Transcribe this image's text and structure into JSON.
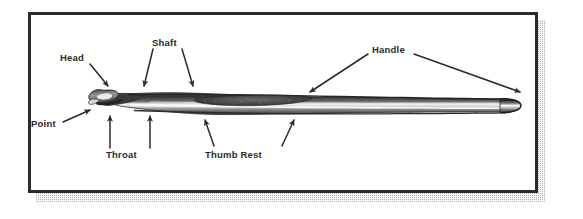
{
  "figure": {
    "frame": {
      "border_color": "#2b2b2b",
      "background_color": "#ffffff",
      "shadow_color": "#9a9a9a"
    },
    "palette": {
      "ink": "#2a2a2a",
      "metal_dark": "#3a3a3a",
      "metal_mid": "#6f6f6f",
      "metal_light": "#d8d8d8",
      "metal_highlight": "#f2f2f2",
      "paper": "#ffffff"
    }
  },
  "labels": [
    {
      "id": "head",
      "text": "Head",
      "arrows": 1
    },
    {
      "id": "point",
      "text": "Point",
      "arrows": 1
    },
    {
      "id": "shaft",
      "text": "Shaft",
      "arrows": 2
    },
    {
      "id": "throat",
      "text": "Throat",
      "arrows": 2
    },
    {
      "id": "thumb_rest",
      "text": "Thumb Rest",
      "arrows": 2
    },
    {
      "id": "handle",
      "text": "Handle",
      "arrows": 2
    }
  ]
}
